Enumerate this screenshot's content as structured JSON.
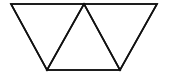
{
  "diagram": {
    "title": "",
    "background": "#ffffff",
    "stroke_color": "#111111",
    "stroke_width": 1.6,
    "shape": "trapezoid divided into three triangles",
    "vertices": {
      "top_left": [
        11,
        4
      ],
      "top_mid": [
        84,
        4
      ],
      "top_right": [
        157,
        4
      ],
      "bottom_left": [
        47,
        70
      ],
      "bottom_right": [
        120,
        70
      ]
    },
    "triangles": [
      {
        "name": "left-downward-triangle",
        "points": "11,4 84,4 47,70"
      },
      {
        "name": "middle-upward-triangle",
        "points": "84,4 47,70 120,70"
      },
      {
        "name": "right-downward-triangle",
        "points": "84,4 157,4 120,70"
      }
    ],
    "outline_points": "11,4 157,4 120,70 47,70"
  }
}
